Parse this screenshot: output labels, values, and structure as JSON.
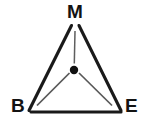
{
  "figure": {
    "kind": "triangle-with-center-point",
    "background_color": "#ffffff",
    "stroke_color": "#1a1a1a",
    "spoke_color": "#5a5a5a",
    "label_color": "#131313",
    "vertices": [
      {
        "id": "M",
        "label": "M",
        "role": "apex",
        "x": 75,
        "y": 23
      },
      {
        "id": "B",
        "label": "B",
        "role": "bottom-left",
        "x": 29,
        "y": 112
      },
      {
        "id": "E",
        "label": "E",
        "role": "bottom-right",
        "x": 121,
        "y": 112
      }
    ],
    "center_point": {
      "id": "center-dot",
      "label": "",
      "x": 74,
      "y": 70,
      "radius": 4.2
    },
    "edges": [
      {
        "id": "edge-M-B",
        "from": "M",
        "to": "B",
        "width": 3.1
      },
      {
        "id": "edge-M-E",
        "from": "M",
        "to": "E",
        "width": 3.1
      },
      {
        "id": "edge-B-E",
        "from": "B",
        "to": "E",
        "width": 3.1
      }
    ],
    "spokes": [
      {
        "id": "spoke-center-M",
        "from": "center",
        "to": "M",
        "width": 1.5,
        "gap": 7
      },
      {
        "id": "spoke-center-B",
        "from": "center",
        "to": "B",
        "width": 1.7,
        "gap": 7
      },
      {
        "id": "spoke-center-E",
        "from": "center",
        "to": "E",
        "width": 1.7,
        "gap": 7
      }
    ]
  }
}
